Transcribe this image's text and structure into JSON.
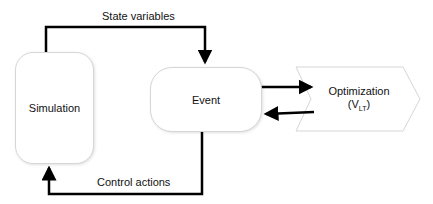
{
  "diagram": {
    "nodes": {
      "simulation": {
        "label": "Simulation",
        "shape": "rounded-rectangle"
      },
      "event": {
        "label": "Event",
        "shape": "rounded-rectangle"
      },
      "optimization": {
        "label": "Optimization",
        "sub_label": "(V",
        "subscript": "LT",
        "sub_close": ")",
        "shape": "hexagon"
      }
    },
    "edges": [
      {
        "from": "simulation",
        "to": "event",
        "label": "State variables"
      },
      {
        "from": "event",
        "to": "simulation",
        "label": "Control actions"
      },
      {
        "from": "event",
        "to": "optimization",
        "label": ""
      },
      {
        "from": "optimization",
        "to": "event",
        "label": ""
      }
    ],
    "colors": {
      "line": "#000000",
      "box_border": "#d6d6d6",
      "background": "#ffffff"
    }
  }
}
